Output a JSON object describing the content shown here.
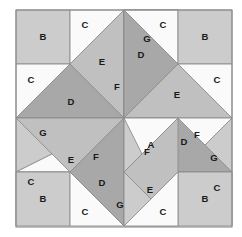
{
  "figure": {
    "width": 242,
    "height": 237,
    "background": "#ffffff"
  },
  "palette": {
    "white": "#fafafa",
    "light_gray": "#cccccc",
    "medium_gray": "#c0c0c0",
    "dark_gray": "#a8a8a8",
    "outline": "#8c8c8c",
    "label_color": "#1a1a1a"
  },
  "block": {
    "x": 16,
    "y": 10,
    "width": 216,
    "height": 217,
    "grid_divisions": 4
  },
  "legend_keys": [
    "A",
    "B",
    "C",
    "D",
    "E",
    "F",
    "G"
  ],
  "pieces": [
    {
      "id": "tl-B",
      "label": "B",
      "shade": "light_gray",
      "points": "16,10 70,10 70,64 16,64",
      "label_x": 43,
      "label_y": 37
    },
    {
      "id": "tl-C1",
      "label": "C",
      "shade": "white",
      "points": "70,10 124,10 70,64",
      "label_x": 85,
      "label_y": 25
    },
    {
      "id": "tl-C2",
      "label": "C",
      "shade": "white",
      "points": "16,64 70,64 16,118",
      "label_x": 31,
      "label_y": 80
    },
    {
      "id": "tl-D",
      "label": "D",
      "shade": "dark_gray",
      "points": "70,64 124,118 16,118",
      "label_x": 71,
      "label_y": 102
    },
    {
      "id": "tl-E",
      "label": "E",
      "shade": "medium_gray",
      "points": "70,64 124,10 124,118",
      "label_x": 102,
      "label_y": 62
    },
    {
      "id": "tc-G",
      "label": "G",
      "shade": "light_gray",
      "points": "124,10 124,118 178,10",
      "label_x": 147,
      "label_y": 39
    },
    {
      "id": "tc-F",
      "label": "F",
      "shade": "white",
      "points": "124,10 178,10 124,118",
      "label_x": 0,
      "label_y": 0,
      "hide_label": true
    },
    {
      "id": "tc-F2",
      "label": "F",
      "shade": "white",
      "points": "124,118 124,10 178,118",
      "label_x": 0,
      "label_y": 0,
      "hide_label": true
    },
    {
      "id": "tr-C1",
      "label": "C",
      "shade": "white",
      "points": "124,10 178,10 178,64",
      "label_x": 163,
      "label_y": 25
    },
    {
      "id": "tr-B",
      "label": "B",
      "shade": "light_gray",
      "points": "178,10 232,10 232,64 178,64",
      "label_x": 205,
      "label_y": 37
    },
    {
      "id": "tr-D",
      "label": "D",
      "shade": "dark_gray",
      "points": "124,10 178,64 124,118",
      "label_x": 141,
      "label_y": 55
    },
    {
      "id": "tr-E",
      "label": "E",
      "shade": "medium_gray",
      "points": "178,64 124,118 232,118",
      "label_x": 177,
      "label_y": 95
    },
    {
      "id": "tr-C2",
      "label": "C",
      "shade": "white",
      "points": "178,64 232,64 232,118",
      "label_x": 217,
      "label_y": 80
    },
    {
      "id": "ml-G",
      "label": "G",
      "shade": "light_gray",
      "points": "16,118 124,118 16,172",
      "label_x": 43,
      "label_y": 133
    },
    {
      "id": "ml-F",
      "label": "F",
      "shade": "white",
      "points": "124,118 124,172 16,172",
      "label_x": 96,
      "label_y": 157
    },
    {
      "id": "ctr-A",
      "label": "A",
      "shade": "light_gray",
      "points": "124,118 178,118 178,172 124,172",
      "label_x": 151,
      "label_y": 145
    },
    {
      "id": "mr-F",
      "label": "F",
      "shade": "white",
      "points": "178,118 232,118 178,172",
      "label_x": 197,
      "label_y": 135
    },
    {
      "id": "mr-G",
      "label": "G",
      "shade": "light_gray",
      "points": "232,118 232,172 178,172",
      "label_x": 214,
      "label_y": 158
    },
    {
      "id": "bl-C1",
      "label": "C",
      "shade": "white",
      "points": "16,172 70,172 16,226",
      "label_x": 31,
      "label_y": 157
    },
    {
      "id": "bl-E",
      "label": "E",
      "shade": "medium_gray",
      "points": "124,118 70,172 16,118",
      "label_x": 0,
      "label_y": 0,
      "hide_label": true
    },
    {
      "id": "bl-B",
      "label": "B",
      "shade": "light_gray",
      "points": "16,172 70,172 70,226 16,226",
      "label_x": 43,
      "label_y": 199
    },
    {
      "id": "bl-C2",
      "label": "C",
      "shade": "white",
      "points": "70,172 124,226 70,226",
      "label_x": 85,
      "label_y": 212
    },
    {
      "id": "bl-D",
      "label": "D",
      "shade": "dark_gray",
      "points": "70,172 124,118 124,226",
      "label_x": 102,
      "label_y": 178
    },
    {
      "id": "bc-F",
      "label": "F",
      "shade": "white",
      "points": "124,118 178,118 124,226",
      "label_x": 147,
      "label_y": 152
    },
    {
      "id": "bc-G",
      "label": "G",
      "shade": "light_gray",
      "points": "124,118 124,226 178,226",
      "label_x": 0,
      "label_y": 0,
      "hide_label": true
    },
    {
      "id": "br-D",
      "label": "D",
      "shade": "dark_gray",
      "points": "178,118 232,172 124,172",
      "label_x": 184,
      "label_y": 142
    },
    {
      "id": "br-E",
      "label": "E",
      "shade": "medium_gray",
      "points": "124,172 178,226 178,118",
      "label_x": 150,
      "label_y": 188
    },
    {
      "id": "br-C1",
      "label": "C",
      "shade": "white",
      "points": "178,172 232,172 232,226",
      "label_x": 217,
      "label_y": 188
    },
    {
      "id": "br-B",
      "label": "B",
      "shade": "light_gray",
      "points": "178,172 232,172 232,226 178,226",
      "label_x": 205,
      "label_y": 199
    },
    {
      "id": "br-C2",
      "label": "C",
      "shade": "white",
      "points": "124,226 178,226 178,172",
      "label_x": 163,
      "label_y": 212
    }
  ],
  "visible_labels": [
    {
      "text": "B",
      "x": 43,
      "y": 37
    },
    {
      "text": "C",
      "x": 85,
      "y": 25
    },
    {
      "text": "G",
      "x": 147,
      "y": 39
    },
    {
      "text": "C",
      "x": 163,
      "y": 25
    },
    {
      "text": "B",
      "x": 205,
      "y": 37
    },
    {
      "text": "C",
      "x": 31,
      "y": 80
    },
    {
      "text": "E",
      "x": 102,
      "y": 62
    },
    {
      "text": "D",
      "x": 141,
      "y": 55
    },
    {
      "text": "C",
      "x": 217,
      "y": 80
    },
    {
      "text": "D",
      "x": 71,
      "y": 102
    },
    {
      "text": "F",
      "x": 117,
      "y": 87
    },
    {
      "text": "E",
      "x": 177,
      "y": 95
    },
    {
      "text": "G",
      "x": 43,
      "y": 133
    },
    {
      "text": "F",
      "x": 96,
      "y": 157
    },
    {
      "text": "A",
      "x": 151,
      "y": 145
    },
    {
      "text": "F",
      "x": 197,
      "y": 135
    },
    {
      "text": "G",
      "x": 214,
      "y": 158
    },
    {
      "text": "E",
      "x": 71,
      "y": 160
    },
    {
      "text": "C",
      "x": 31,
      "y": 182
    },
    {
      "text": "F",
      "x": 147,
      "y": 152
    },
    {
      "text": "D",
      "x": 184,
      "y": 142
    },
    {
      "text": "C",
      "x": 217,
      "y": 188
    },
    {
      "text": "D",
      "x": 102,
      "y": 183
    },
    {
      "text": "E",
      "x": 150,
      "y": 190
    },
    {
      "text": "B",
      "x": 43,
      "y": 199
    },
    {
      "text": "C",
      "x": 85,
      "y": 212
    },
    {
      "text": "G",
      "x": 120,
      "y": 205
    },
    {
      "text": "C",
      "x": 163,
      "y": 212
    },
    {
      "text": "B",
      "x": 205,
      "y": 199
    }
  ]
}
